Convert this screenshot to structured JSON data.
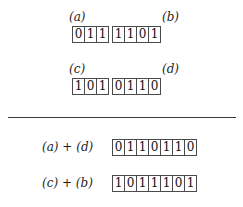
{
  "figure": {
    "type": "crossover-diagram",
    "background_color": "#ffffff",
    "box_border_color": "#4a4a4a",
    "text_color": "#1a1a1a",
    "divider_color": "#3c3c3c"
  },
  "parents": [
    {
      "id": "parent-1",
      "left_label": "(a)",
      "right_label": "(b)",
      "segments": [
        {
          "name": "a",
          "bits": [
            "0",
            "1",
            "1"
          ]
        },
        {
          "name": "b",
          "bits": [
            "1",
            "1",
            "0",
            "1"
          ]
        }
      ]
    },
    {
      "id": "parent-2",
      "left_label": "(c)",
      "right_label": "(d)",
      "segments": [
        {
          "name": "c",
          "bits": [
            "1",
            "0",
            "1"
          ]
        },
        {
          "name": "d",
          "bits": [
            "0",
            "1",
            "1",
            "0"
          ]
        }
      ]
    }
  ],
  "offspring": [
    {
      "id": "child-1",
      "expression": "(a) + (d)",
      "bits": [
        "0",
        "1",
        "1",
        "0",
        "1",
        "1",
        "0"
      ]
    },
    {
      "id": "child-2",
      "expression": "(c) + (b)",
      "bits": [
        "1",
        "0",
        "1",
        "1",
        "1",
        "0",
        "1"
      ]
    }
  ]
}
